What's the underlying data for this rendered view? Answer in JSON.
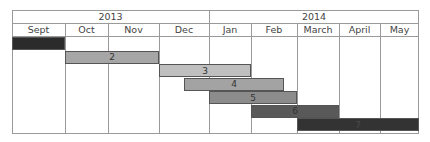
{
  "chart_data": {
    "type": "gantt",
    "title": "",
    "years": [
      {
        "label": "2013",
        "months": [
          "Sept",
          "Oct",
          "Nov",
          "Dec"
        ]
      },
      {
        "label": "2014",
        "months": [
          "Jan",
          "Feb",
          "March",
          "April",
          "May"
        ]
      }
    ],
    "months": [
      "Sept",
      "Oct",
      "Nov",
      "Dec",
      "Jan",
      "Feb",
      "March",
      "April",
      "May"
    ],
    "column_edges_px": [
      0,
      53,
      96,
      147,
      197,
      239,
      285,
      327,
      368,
      407
    ],
    "tasks": [
      {
        "label": "1",
        "start_px": 0,
        "end_px": 53,
        "start": "Sept 2013 start",
        "end": "Sept 2013 end",
        "color": "#2b2b2b",
        "text_color": "#2b2b2b"
      },
      {
        "label": "2",
        "start_px": 53,
        "end_px": 147,
        "start": "Oct 2013 start",
        "end": "Nov 2013 end",
        "color": "#a6a6a6",
        "text_color": "#333333"
      },
      {
        "label": "3",
        "start_px": 147,
        "end_px": 239,
        "start": "Dec 2013 start",
        "end": "Jan 2014 end",
        "color": "#bfbfbf",
        "text_color": "#333333"
      },
      {
        "label": "4",
        "start_px": 172,
        "end_px": 272,
        "start": "mid Dec 2013",
        "end": "late Feb 2014",
        "color": "#a3a3a3",
        "text_color": "#333333"
      },
      {
        "label": "5",
        "start_px": 197,
        "end_px": 285,
        "start": "Jan 2014 start",
        "end": "Feb 2014 end",
        "color": "#8c8c8c",
        "text_color": "#333333"
      },
      {
        "label": "6",
        "start_px": 239,
        "end_px": 327,
        "start": "Feb 2014 start",
        "end": "March 2014 end",
        "color": "#595959",
        "text_color": "#333333"
      },
      {
        "label": "7",
        "start_px": 285,
        "end_px": 407,
        "start": "March 2014 start",
        "end": "May 2014 end",
        "color": "#333333",
        "text_color": "#4a4a4a"
      }
    ],
    "colors": {
      "grid": "#9a9a9a",
      "background": "#ffffff"
    },
    "grid": true,
    "legend": "none"
  }
}
